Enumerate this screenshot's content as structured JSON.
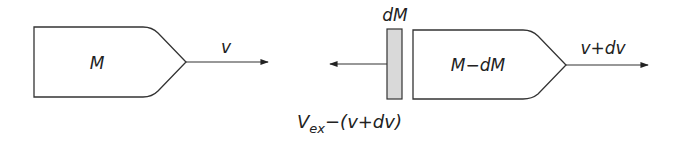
{
  "diagram": {
    "colors": {
      "stroke": "#333333",
      "fill": "#ffffff",
      "exhaust_fill": "#d9d9d9",
      "text": "#222222"
    },
    "before": {
      "body_label": "M",
      "velocity_label": "v"
    },
    "after": {
      "ejected_mass_label": "dM",
      "body_label": "M−dM",
      "velocity_label": "v+dv",
      "exhaust_velocity_label_main": "V",
      "exhaust_velocity_label_sub": "ex",
      "exhaust_velocity_label_rest": "−(v+dv)"
    }
  }
}
